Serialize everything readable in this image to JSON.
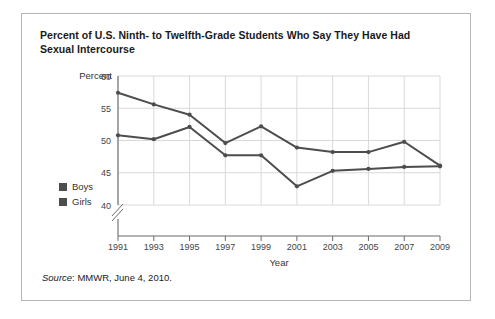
{
  "card": {
    "title": "Percent of U.S. Ninth- to Twelfth-Grade Students Who Say They Have Had Sexual Intercourse",
    "source_prefix": "Source",
    "source_text": ": MMWR, June 4, 2010."
  },
  "chart_data": {
    "type": "line",
    "title": "Percent of U.S. Ninth- to Twelfth-Grade Students Who Say They Have Had Sexual Intercourse",
    "xlabel": "Year",
    "ylabel": "Percent",
    "categories": [
      1991,
      1993,
      1995,
      1997,
      1999,
      2001,
      2003,
      2005,
      2007,
      2009
    ],
    "xtick_labels": [
      "1991",
      "1993",
      "1995",
      "1997",
      "1999",
      "2001",
      "2003",
      "2005",
      "2007",
      "2009"
    ],
    "ytick_labels": [
      "40",
      "45",
      "50",
      "55",
      "60"
    ],
    "yticks": [
      40,
      45,
      50,
      55,
      60
    ],
    "ylim": [
      40,
      60
    ],
    "xlim": [
      1991,
      2009
    ],
    "axis_break": true,
    "grid": true,
    "legend_position": "left-outside",
    "series": [
      {
        "name": "Boys",
        "color": "#4d4d4d",
        "values": [
          57.4,
          55.6,
          54.0,
          49.6,
          52.2,
          48.9,
          48.2,
          48.2,
          49.8,
          46.1
        ]
      },
      {
        "name": "Girls",
        "color": "#4d4d4d",
        "values": [
          50.8,
          50.2,
          52.1,
          47.7,
          47.7,
          42.9,
          45.3,
          45.6,
          45.9,
          46.0
        ]
      }
    ]
  }
}
